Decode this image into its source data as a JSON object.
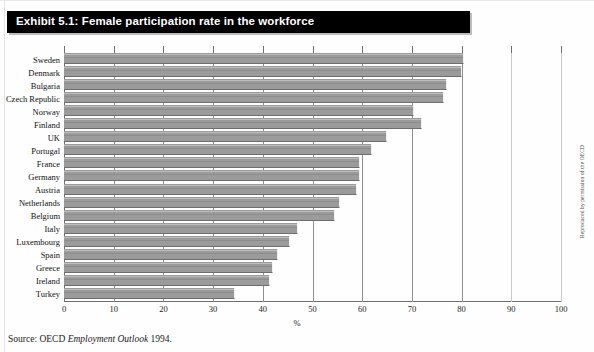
{
  "exhibit": {
    "title": "Exhibit 5.1: Female participation rate in the workforce",
    "source_prefix": "Source: OECD ",
    "source_italic": "Employment Outlook",
    "source_suffix": " 1994.",
    "credit": "Reproduced by permission of the OECD"
  },
  "chart_data": {
    "type": "bar",
    "orientation": "horizontal",
    "title": "Exhibit 5.1: Female participation rate in the workforce",
    "xlabel": "%",
    "ylabel": "",
    "xlim": [
      0,
      100
    ],
    "xticks": [
      0,
      10,
      20,
      30,
      40,
      50,
      60,
      70,
      80,
      90,
      100
    ],
    "grid": true,
    "legend": null,
    "bar_color": "#9b9b9b",
    "categories": [
      "Sweden",
      "Denmark",
      "Bulgaria",
      "Czech Republic",
      "Norway",
      "Finland",
      "UK",
      "Portugal",
      "France",
      "Germany",
      "Austria",
      "Netherlands",
      "Belgium",
      "Italy",
      "Luxembourg",
      "Spain",
      "Greece",
      "Ireland",
      "Turkey"
    ],
    "values": [
      80.5,
      80,
      77,
      76.5,
      70.5,
      72,
      65,
      62,
      59.5,
      59.5,
      59,
      55.5,
      54.5,
      47,
      45.5,
      43,
      42,
      41.5,
      34.5
    ]
  }
}
